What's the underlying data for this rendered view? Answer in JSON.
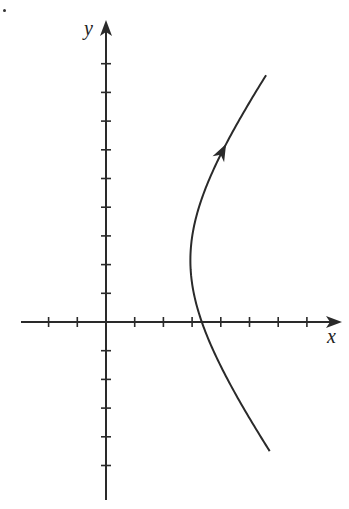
{
  "labels": {
    "x_axis": "x",
    "y_axis": "y"
  },
  "colors": {
    "ink": "#2a2a2a",
    "background": "#ffffff"
  },
  "chart_data": {
    "type": "line",
    "title": "",
    "xlabel": "x",
    "ylabel": "y",
    "origin_px": [
      106,
      322
    ],
    "unit_px": 28.7,
    "x_ticks": [
      -2,
      -1,
      1,
      2,
      3,
      4,
      5,
      6,
      7
    ],
    "y_ticks": [
      -5,
      -4,
      -3,
      -2,
      -1,
      1,
      2,
      3,
      4,
      5,
      6,
      7,
      8,
      9
    ],
    "xlim": [
      -3,
      8.2
    ],
    "ylim": [
      -6.2,
      10.5
    ],
    "grid": false,
    "curve": {
      "kind": "hyperbola",
      "center": [
        0,
        2.15
      ],
      "a": 2.94,
      "b": 4.0,
      "y_range": [
        -4.5,
        8.6
      ],
      "direction": "increasing y",
      "arrow_at_y": 6.2
    }
  }
}
